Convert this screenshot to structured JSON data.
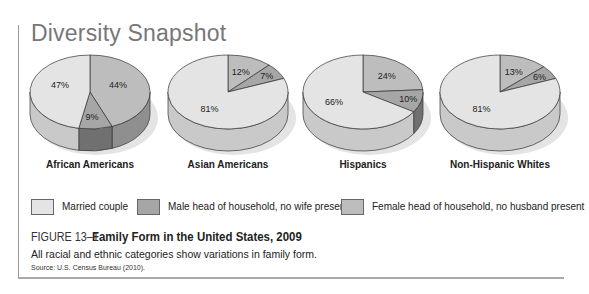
{
  "header": {
    "title": "Diversity Snapshot"
  },
  "colors": {
    "married": "#e4e4e4",
    "married_side": "#c9c9c9",
    "male": "#a6a6a6",
    "male_side": "#707070",
    "female": "#bdbdbd",
    "female_side": "#8f8f8f",
    "outline": "#333333"
  },
  "legend": [
    {
      "key": "married",
      "label": "Married couple"
    },
    {
      "key": "male",
      "label": "Male head of household, no wife present"
    },
    {
      "key": "female",
      "label": "Female head of household, no husband present"
    }
  ],
  "figure": {
    "number": "FIGURE 13–1",
    "title": "Family Form in the United States, 2009",
    "caption": "All racial and ethnic categories show variations in family form.",
    "source": "Source: U.S. Census Bureau (2010)."
  },
  "chart_data": {
    "type": "pie",
    "title": "Family Form in the United States, 2009",
    "legend_position": "bottom",
    "categories": [
      "Married couple",
      "Male head of household, no wife present",
      "Female head of household, no husband present"
    ],
    "pies": [
      {
        "name": "African Americans",
        "values": {
          "married": 47,
          "male": 9,
          "female": 44
        },
        "labels": {
          "married": "47%",
          "male": "9%",
          "female": "44%"
        }
      },
      {
        "name": "Asian Americans",
        "values": {
          "married": 81,
          "male": 7,
          "female": 12
        },
        "labels": {
          "married": "81%",
          "male": "7%",
          "female": "12%"
        }
      },
      {
        "name": "Hispanics",
        "values": {
          "married": 66,
          "male": 10,
          "female": 24
        },
        "labels": {
          "married": "66%",
          "male": "10%",
          "female": "24%"
        }
      },
      {
        "name": "Non-Hispanic Whites",
        "values": {
          "married": 81,
          "male": 6,
          "female": 13
        },
        "labels": {
          "married": "81%",
          "male": "6%",
          "female": "13%"
        }
      }
    ]
  }
}
